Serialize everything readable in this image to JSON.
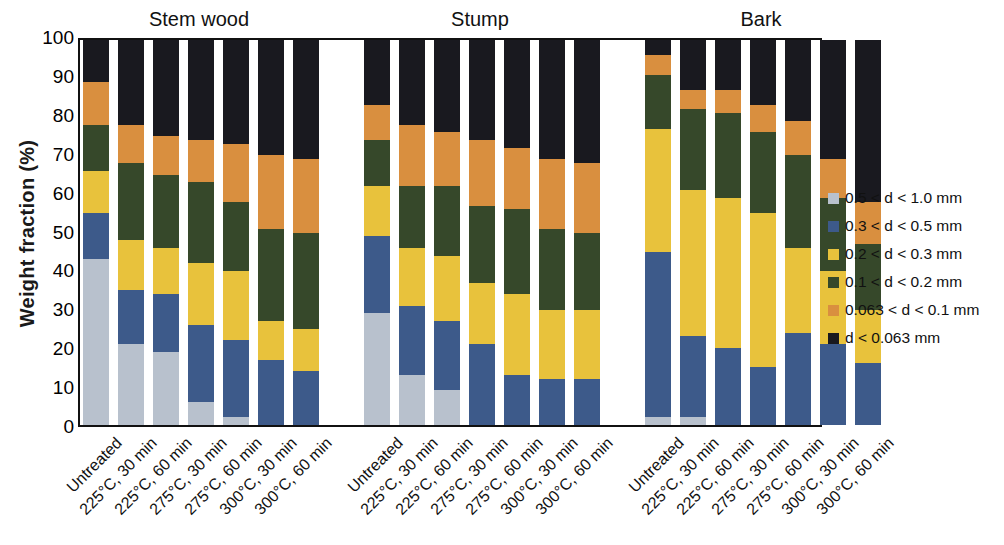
{
  "axes": {
    "ylabel": "Weight  fraction (%)",
    "yticks": [
      "100",
      "90",
      "80",
      "70",
      "60",
      "50",
      "40",
      "30",
      "20",
      "10",
      "0"
    ],
    "ymin": 0,
    "ymax": 100
  },
  "groups": [
    {
      "name": "Stem wood"
    },
    {
      "name": "Stump"
    },
    {
      "name": "Bark"
    }
  ],
  "categories": [
    "Untreated",
    "225°C, 30 min",
    "225°C, 60 min",
    "275°C, 30 min",
    "275°C, 60 min",
    "300°C, 30 min",
    "300°C, 60 min"
  ],
  "legend": [
    {
      "label": "0.5 < d < 1.0 mm",
      "color": "#b8c1cd"
    },
    {
      "label": "0.3 < d < 0.5 mm",
      "color": "#3d5a8a"
    },
    {
      "label": "0.2 < d < 0.3 mm",
      "color": "#e8c23c"
    },
    {
      "label": "0.1 < d < 0.2 mm",
      "color": "#36482a"
    },
    {
      "label": "0.063 < d < 0.1 mm",
      "color": "#d98f3f"
    },
    {
      "label": "d < 0.063 mm",
      "color": "#19191f"
    }
  ],
  "chart_data": {
    "type": "bar",
    "subtype": "stacked-bar-grouped",
    "title": "",
    "xlabel": "",
    "ylabel": "Weight  fraction (%)",
    "ylim": [
      0,
      100
    ],
    "ytick_step": 10,
    "grid": false,
    "legend_position": "right",
    "groups": [
      "Stem wood",
      "Stump",
      "Bark"
    ],
    "categories": [
      "Untreated",
      "225°C, 30 min",
      "225°C, 60 min",
      "275°C, 30 min",
      "275°C, 60 min",
      "300°C, 30 min",
      "300°C, 60 min"
    ],
    "series": [
      {
        "name": "d < 0.063 mm",
        "color": "#19191f",
        "values": {
          "Stem wood": [
            11,
            22,
            25,
            26,
            27,
            30,
            31
          ],
          "Stump": [
            17,
            22,
            24,
            26,
            28,
            31,
            32
          ],
          "Bark": [
            4,
            13,
            13,
            17,
            21,
            31,
            42
          ]
        }
      },
      {
        "name": "0.063 < d < 0.1 mm",
        "color": "#d98f3f",
        "values": {
          "Stem wood": [
            11,
            10,
            10,
            11,
            15,
            19,
            19
          ],
          "Stump": [
            9,
            16,
            14,
            17,
            16,
            18,
            18
          ],
          "Bark": [
            5,
            5,
            6,
            7,
            9,
            10,
            11
          ]
        }
      },
      {
        "name": "0.1 < d < 0.2 mm",
        "color": "#36482a",
        "values": {
          "Stem wood": [
            12,
            20,
            19,
            21,
            18,
            24,
            25
          ],
          "Stump": [
            12,
            16,
            18,
            20,
            22,
            21,
            20
          ],
          "Bark": [
            14,
            21,
            22,
            21,
            24,
            19,
            17
          ]
        }
      },
      {
        "name": "0.2 < d < 0.3 mm",
        "color": "#e8c23c",
        "values": {
          "Stem wood": [
            11,
            13,
            12,
            16,
            18,
            10,
            11
          ],
          "Stump": [
            13,
            15,
            17,
            16,
            21,
            18,
            18
          ],
          "Bark": [
            32,
            38,
            39,
            40,
            22,
            19,
            14
          ]
        }
      },
      {
        "name": "0.3 < d < 0.5 mm",
        "color": "#3d5a8a",
        "values": {
          "Stem wood": [
            12,
            14,
            15,
            20,
            20,
            17,
            14
          ],
          "Stump": [
            20,
            18,
            18,
            21,
            13,
            12,
            12
          ],
          "Bark": [
            43,
            21,
            20,
            15,
            24,
            21,
            16
          ]
        }
      },
      {
        "name": "0.5 < d < 1.0 mm",
        "color": "#b8c1cd",
        "values": {
          "Stem wood": [
            43,
            21,
            19,
            6,
            2,
            0,
            0
          ],
          "Stump": [
            29,
            13,
            9,
            0,
            0,
            0,
            0
          ],
          "Bark": [
            2,
            2,
            0,
            0,
            0,
            0,
            0
          ]
        }
      }
    ]
  }
}
